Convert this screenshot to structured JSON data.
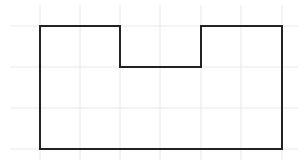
{
  "diagram": {
    "type": "rectilinear-shape-on-grid",
    "grid": {
      "color": "#e8e8e8",
      "cell_size": 40.7,
      "x_lines": [
        40,
        80,
        120,
        160,
        201,
        241,
        282
      ],
      "y_lines": [
        26,
        67,
        108,
        149
      ],
      "x_extent": [
        10,
        298
      ],
      "y_extent": [
        5,
        160
      ]
    },
    "shape": {
      "stroke": "#222222",
      "stroke_width": 2,
      "points": "40,26 120,26 120,67 201,67 201,26 282,26 282,149 40,149"
    }
  }
}
